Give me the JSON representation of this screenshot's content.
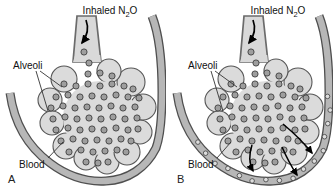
{
  "figure": {
    "type": "two-panel-diagram",
    "colors": {
      "background": "#ffffff",
      "alveoli_fill": "#dbdbdb",
      "alveoli_outline": "#565656",
      "airway_fill": "#d9d9d9",
      "airway_outline": "#6b6b6b",
      "vessel_fill": "#b7b7b7",
      "vessel_outline": "#4f4f4f",
      "gas_molecule_fill": "#9e9e9e",
      "gas_molecule_outline": "#3f3f3f",
      "blood_molecule_fill": "#dcdcdc",
      "arrow_color": "#000000",
      "text_color": "#111111"
    },
    "panels": [
      {
        "letter": "A",
        "labels": {
          "inhaled_pre": "Inhaled N",
          "inhaled_sub": "2",
          "inhaled_post": "O",
          "alveoli": "Alveoli",
          "blood": "Blood"
        },
        "blood_contains_n2o": false,
        "transfer_arrow_count": 0
      },
      {
        "letter": "B",
        "labels": {
          "inhaled_pre": "Inhaled N",
          "inhaled_sub": "2",
          "inhaled_post": "O",
          "alveoli": "Alveoli",
          "blood": "Blood"
        },
        "blood_contains_n2o": true,
        "transfer_arrow_count": 3
      }
    ]
  }
}
